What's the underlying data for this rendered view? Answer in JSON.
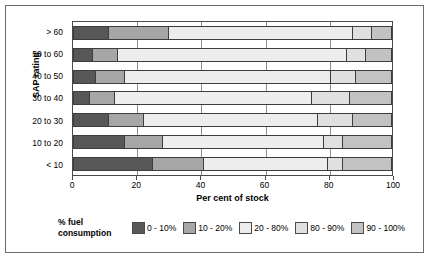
{
  "chart": {
    "type": "figure",
    "y_axis_title": "SAP rating",
    "x_axis_title": "Per cent of stock",
    "legend_title_line1": "% fuel",
    "legend_title_line2": "consumption"
  },
  "chart_data": {
    "type": "bar",
    "orientation": "horizontal",
    "stacked": true,
    "normalized": true,
    "title": "",
    "xlabel": "Per cent of stock",
    "ylabel": "SAP rating",
    "xlim": [
      0,
      100
    ],
    "xticks": [
      0,
      20,
      40,
      60,
      80,
      100
    ],
    "xticklabels": [
      "0",
      "20",
      "40",
      "60",
      "80",
      "100"
    ],
    "grid": true,
    "legend_position": "bottom",
    "categories": [
      "> 60",
      "50 to 60",
      "40 to 50",
      "30 to 40",
      "20 to 30",
      "10 to 20",
      "< 10"
    ],
    "series": [
      {
        "name": "0 - 10%",
        "color": "#575757",
        "values": [
          11,
          6,
          7,
          5,
          11,
          16,
          25
        ]
      },
      {
        "name": "10 - 20%",
        "color": "#a6a6a6",
        "values": [
          19,
          8,
          9,
          8,
          11,
          12,
          16
        ]
      },
      {
        "name": "20 - 80%",
        "color": "#ededed",
        "values": [
          58,
          72,
          65,
          62,
          55,
          51,
          39
        ]
      },
      {
        "name": "80 - 90%",
        "color": "#e0e0e0",
        "values": [
          6,
          6,
          8,
          12,
          11,
          6,
          5
        ]
      },
      {
        "name": "90 - 100%",
        "color": "#c2c2c2",
        "values": [
          6,
          8,
          11,
          13,
          12,
          15,
          15
        ]
      }
    ]
  }
}
